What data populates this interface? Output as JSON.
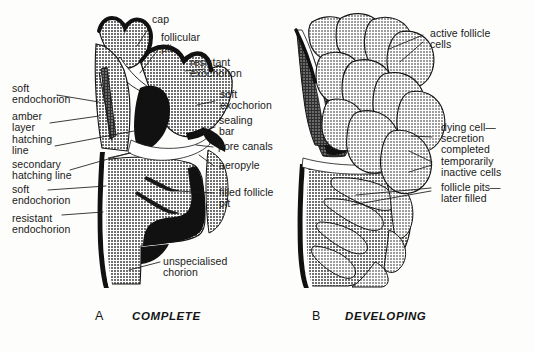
{
  "figure": {
    "background_color": "#fdfdfb",
    "ink_color": "#1a1a1a"
  },
  "palette": {
    "mid_gray": "#8d8d8d",
    "light_gray": "#a8a8a8",
    "dark_gray": "#4a4a4a",
    "black": "#111111",
    "white": "#ffffff",
    "outline": "#141414"
  },
  "panels": [
    {
      "letter": "A",
      "caption": "COMPLETE"
    },
    {
      "letter": "B",
      "caption": "DEVELOPING"
    }
  ],
  "labels_panel_a": {
    "cap": "cap",
    "follicular_pit": "follicular\npit",
    "resistant_exochorion": "resistant\nexochorion",
    "soft_exochorion": "soft\nexochorion",
    "sealing_bar": "sealing\nbar",
    "pore_canals": "pore canals",
    "aeropyle": "aeropyle",
    "filled_follicle_pit": "filled follicle\npit",
    "soft_endochorion_upper": "soft\nendochorion",
    "amber_layer": "amber\nlayer",
    "hatching_line": "hatching\nline",
    "secondary_hatching_line": "secondary\nhatching line",
    "soft_endochorion_lower": "soft\nendochorion",
    "resistant_endochorion": "resistant\nendochorion",
    "unspecialised_chorion": "unspecialised\nchorion"
  },
  "labels_panel_b": {
    "active_follicle_cells": "active follicle\ncells",
    "dying_cell_secretion_completed": "dying cell—\nsecretion\ncompleted",
    "temporarily_inactive_cells": "temporarily\ninactive cells",
    "follicle_pits_later_filled": "follicle pits—\nlater filled"
  }
}
